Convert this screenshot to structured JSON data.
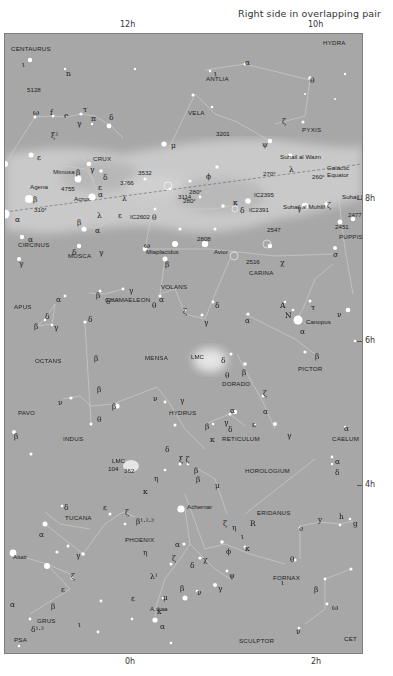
{
  "caption": "Right side in overlapping pair",
  "hour_labels": {
    "top": [
      {
        "text": "12h",
        "x": 120
      },
      {
        "text": "10h",
        "x": 308
      }
    ],
    "right": [
      {
        "text": "8h",
        "y": 198
      },
      {
        "text": "6h",
        "y": 340
      },
      {
        "text": "4h",
        "y": 484
      }
    ],
    "bottom": [
      {
        "text": "0h",
        "x": 125
      },
      {
        "text": "2h",
        "x": 311
      }
    ]
  },
  "colors": {
    "sky": "#a7a7a7",
    "milky_way": "#c4c4c4",
    "lines": "#cfcfcf",
    "stars": "#ffffff"
  },
  "constellations": [
    {
      "name": "CENTAURUS",
      "x": 6,
      "y": 12
    },
    {
      "name": "HYDRA",
      "x": 318,
      "y": 6
    },
    {
      "name": "ANTLIA",
      "x": 201,
      "y": 42
    },
    {
      "name": "VELA",
      "x": 183,
      "y": 76
    },
    {
      "name": "PYXIS",
      "x": 297,
      "y": 93
    },
    {
      "name": "CRUX",
      "x": 88,
      "y": 122
    },
    {
      "name": "CARINA",
      "x": 244,
      "y": 236
    },
    {
      "name": "PUPPIS",
      "x": 334,
      "y": 200
    },
    {
      "name": "CIRCINUS",
      "x": 13,
      "y": 208
    },
    {
      "name": "MUSCA",
      "x": 63,
      "y": 219
    },
    {
      "name": "CHAMAELEON",
      "x": 100,
      "y": 263
    },
    {
      "name": "APUS",
      "x": 9,
      "y": 270
    },
    {
      "name": "VOLANS",
      "x": 156,
      "y": 250
    },
    {
      "name": "OCTANS",
      "x": 30,
      "y": 324
    },
    {
      "name": "MENSA",
      "x": 140,
      "y": 321
    },
    {
      "name": "PICTOR",
      "x": 293,
      "y": 332
    },
    {
      "name": "DORADO",
      "x": 217,
      "y": 347
    },
    {
      "name": "PAVO",
      "x": 13,
      "y": 376
    },
    {
      "name": "HYDRUS",
      "x": 164,
      "y": 376
    },
    {
      "name": "INDUS",
      "x": 58,
      "y": 402
    },
    {
      "name": "RETICULUM",
      "x": 217,
      "y": 402
    },
    {
      "name": "CAELUM",
      "x": 327,
      "y": 402
    },
    {
      "name": "HOROLOGIUM",
      "x": 240,
      "y": 434
    },
    {
      "name": "TUCANA",
      "x": 60,
      "y": 481
    },
    {
      "name": "ERIDANUS",
      "x": 252,
      "y": 476
    },
    {
      "name": "PHOENIX",
      "x": 120,
      "y": 503
    },
    {
      "name": "FORNAX",
      "x": 268,
      "y": 541
    },
    {
      "name": "GRUS",
      "x": 32,
      "y": 584
    },
    {
      "name": "SCULPTOR",
      "x": 234,
      "y": 604
    },
    {
      "name": "PsA",
      "x": 9,
      "y": 603
    },
    {
      "name": "Cet",
      "x": 339,
      "y": 602
    }
  ],
  "named_stars": [
    {
      "name": "Mimosa",
      "x": 48,
      "y": 135
    },
    {
      "name": "Agena",
      "x": 25,
      "y": 150
    },
    {
      "name": "Acrux",
      "x": 69,
      "y": 162
    },
    {
      "name": "Miaplacidus",
      "x": 141,
      "y": 215
    },
    {
      "name": "Avior",
      "x": 209,
      "y": 215
    },
    {
      "name": "Suhail al Wazn",
      "x": 275,
      "y": 120
    },
    {
      "name": "Suhail al Muhlif",
      "x": 278,
      "y": 170
    },
    {
      "name": "Suhail Hadar",
      "x": 337,
      "y": 160
    },
    {
      "name": "Canopus",
      "x": 301,
      "y": 285
    },
    {
      "name": "Achernar",
      "x": 182,
      "y": 470
    },
    {
      "name": "Ankaa",
      "x": 145,
      "y": 572
    },
    {
      "name": "Altair",
      "x": 8,
      "y": 520
    }
  ],
  "deep_sky": [
    {
      "id": "5128",
      "x": 22,
      "y": 53
    },
    {
      "id": "3201",
      "x": 211,
      "y": 97
    },
    {
      "id": "4755",
      "x": 56,
      "y": 152
    },
    {
      "id": "3532",
      "x": 133,
      "y": 136
    },
    {
      "id": "3766",
      "x": 115,
      "y": 146
    },
    {
      "id": "3114",
      "x": 173,
      "y": 160
    },
    {
      "id": "IC2602",
      "x": 125,
      "y": 180
    },
    {
      "id": "IC2395",
      "x": 249,
      "y": 158
    },
    {
      "id": "IC2391",
      "x": 244,
      "y": 173
    },
    {
      "id": "2547",
      "x": 262,
      "y": 193
    },
    {
      "id": "2808",
      "x": 192,
      "y": 202
    },
    {
      "id": "2516",
      "x": 241,
      "y": 225
    },
    {
      "id": "2477",
      "x": 343,
      "y": 178
    },
    {
      "id": "2451",
      "x": 330,
      "y": 190
    },
    {
      "id": "104",
      "x": 103,
      "y": 432
    },
    {
      "id": "362",
      "x": 119,
      "y": 434
    }
  ],
  "galactic": {
    "label": "Galactic Equator",
    "longitudes": [
      {
        "text": "310°",
        "x": 29,
        "y": 173
      },
      {
        "text": "280°",
        "x": 184,
        "y": 155
      },
      {
        "text": "270°",
        "x": 258,
        "y": 137
      },
      {
        "text": "260°",
        "x": 307,
        "y": 140
      },
      {
        "text": "280°",
        "x": 178,
        "y": 164
      }
    ]
  },
  "clouds": [
    {
      "name": "LMC",
      "x": 186,
      "y": 320
    },
    {
      "name": "LMC",
      "x": 107,
      "y": 424
    }
  ],
  "greek_labels": [
    {
      "t": "ι",
      "x": 17,
      "y": 27
    },
    {
      "t": "n",
      "x": 61,
      "y": 36
    },
    {
      "t": "ι",
      "x": 209,
      "y": 36
    },
    {
      "t": "ω",
      "x": 28,
      "y": 75
    },
    {
      "t": "f",
      "x": 45,
      "y": 75
    },
    {
      "t": "e",
      "x": 59,
      "y": 78
    },
    {
      "t": "τ",
      "x": 78,
      "y": 72
    },
    {
      "t": "γ",
      "x": 72,
      "y": 86
    },
    {
      "t": "π",
      "x": 86,
      "y": 81
    },
    {
      "t": "δ",
      "x": 104,
      "y": 80
    },
    {
      "t": "ξ²",
      "x": 46,
      "y": 98
    },
    {
      "t": "ε",
      "x": 32,
      "y": 120
    },
    {
      "t": "α",
      "x": 240,
      "y": 25
    },
    {
      "t": "θ",
      "x": 305,
      "y": 43
    },
    {
      "t": "ζ",
      "x": 277,
      "y": 84
    },
    {
      "t": "μ",
      "x": 166,
      "y": 108
    },
    {
      "t": "ψ",
      "x": 257,
      "y": 107
    },
    {
      "t": "λ",
      "x": 284,
      "y": 132
    },
    {
      "t": "β",
      "x": 71,
      "y": 135
    },
    {
      "t": "γ",
      "x": 85,
      "y": 132
    },
    {
      "t": "δ",
      "x": 98,
      "y": 140
    },
    {
      "t": "ε",
      "x": 93,
      "y": 150
    },
    {
      "t": "β",
      "x": 28,
      "y": 162
    },
    {
      "t": "α",
      "x": 93,
      "y": 157
    },
    {
      "t": "λ",
      "x": 117,
      "y": 161
    },
    {
      "t": "α",
      "x": 10,
      "y": 182
    },
    {
      "t": "β",
      "x": 72,
      "y": 185
    },
    {
      "t": "λ",
      "x": 92,
      "y": 178
    },
    {
      "t": "α",
      "x": 90,
      "y": 193
    },
    {
      "t": "ε",
      "x": 113,
      "y": 178
    },
    {
      "t": "θ",
      "x": 147,
      "y": 180
    },
    {
      "t": "ω",
      "x": 139,
      "y": 208
    },
    {
      "t": "α",
      "x": 23,
      "y": 202
    },
    {
      "t": "δ",
      "x": 67,
      "y": 215
    },
    {
      "t": "γ",
      "x": 94,
      "y": 215
    },
    {
      "t": "ϕ",
      "x": 201,
      "y": 139
    },
    {
      "t": "δ",
      "x": 235,
      "y": 173
    },
    {
      "t": "κ",
      "x": 228,
      "y": 165
    },
    {
      "t": "γ",
      "x": 292,
      "y": 171
    },
    {
      "t": "ζ",
      "x": 322,
      "y": 168
    },
    {
      "t": "σ",
      "x": 328,
      "y": 217
    },
    {
      "t": "χ",
      "x": 275,
      "y": 225
    },
    {
      "t": "γ",
      "x": 14,
      "y": 226
    },
    {
      "t": "β",
      "x": 160,
      "y": 227
    },
    {
      "t": "β",
      "x": 91,
      "y": 258
    },
    {
      "t": "γ",
      "x": 124,
      "y": 253
    },
    {
      "t": "δ¹·²",
      "x": 101,
      "y": 264
    },
    {
      "t": "α",
      "x": 154,
      "y": 262
    },
    {
      "t": "θ",
      "x": 147,
      "y": 268
    },
    {
      "t": "α",
      "x": 51,
      "y": 262
    },
    {
      "t": "δ",
      "x": 40,
      "y": 279
    },
    {
      "t": "β",
      "x": 29,
      "y": 289
    },
    {
      "t": "γ",
      "x": 49,
      "y": 290
    },
    {
      "t": "δ",
      "x": 83,
      "y": 282
    },
    {
      "t": "ζ",
      "x": 178,
      "y": 274
    },
    {
      "t": "δ",
      "x": 210,
      "y": 268
    },
    {
      "t": "γ",
      "x": 199,
      "y": 285
    },
    {
      "t": "α",
      "x": 240,
      "y": 283
    },
    {
      "t": "A",
      "x": 275,
      "y": 268
    },
    {
      "t": "N",
      "x": 280,
      "y": 278
    },
    {
      "t": "τ",
      "x": 306,
      "y": 270
    },
    {
      "t": "ν",
      "x": 332,
      "y": 277
    },
    {
      "t": "α",
      "x": 295,
      "y": 294
    },
    {
      "t": "δ",
      "x": 216,
      "y": 323
    },
    {
      "t": "θ",
      "x": 220,
      "y": 338
    },
    {
      "t": "β",
      "x": 237,
      "y": 335
    },
    {
      "t": "β",
      "x": 310,
      "y": 319
    },
    {
      "t": "ζ",
      "x": 258,
      "y": 356
    },
    {
      "t": "β",
      "x": 89,
      "y": 321
    },
    {
      "t": "β",
      "x": 92,
      "y": 352
    },
    {
      "t": "ν",
      "x": 53,
      "y": 365
    },
    {
      "t": "β",
      "x": 107,
      "y": 369
    },
    {
      "t": "θ",
      "x": 92,
      "y": 382
    },
    {
      "t": "ν",
      "x": 148,
      "y": 361
    },
    {
      "t": "γ",
      "x": 175,
      "y": 363
    },
    {
      "t": "β",
      "x": 9,
      "y": 399
    },
    {
      "t": "α",
      "x": 225,
      "y": 373
    },
    {
      "t": "α",
      "x": 258,
      "y": 374
    },
    {
      "t": "γ",
      "x": 282,
      "y": 398
    },
    {
      "t": "β",
      "x": 200,
      "y": 389
    },
    {
      "t": "γ",
      "x": 219,
      "y": 385
    },
    {
      "t": "δ",
      "x": 223,
      "y": 392
    },
    {
      "t": "ε",
      "x": 247,
      "y": 387
    },
    {
      "t": "κ",
      "x": 205,
      "y": 402
    },
    {
      "t": "ξ ζ",
      "x": 174,
      "y": 422
    },
    {
      "t": "δ",
      "x": 160,
      "y": 412
    },
    {
      "t": "β",
      "x": 189,
      "y": 433
    },
    {
      "t": "η",
      "x": 149,
      "y": 441
    },
    {
      "t": "κ",
      "x": 138,
      "y": 454
    },
    {
      "t": "μ",
      "x": 210,
      "y": 448
    },
    {
      "t": "β",
      "x": 191,
      "y": 442
    },
    {
      "t": "ζ",
      "x": 218,
      "y": 486
    },
    {
      "t": "η",
      "x": 227,
      "y": 490
    },
    {
      "t": "ι",
      "x": 236,
      "y": 499
    },
    {
      "t": "R",
      "x": 245,
      "y": 486
    },
    {
      "t": "α",
      "x": 330,
      "y": 424
    },
    {
      "t": "δ",
      "x": 330,
      "y": 435
    },
    {
      "t": "α",
      "x": 339,
      "y": 391
    },
    {
      "t": "e",
      "x": 294,
      "y": 491
    },
    {
      "t": "y",
      "x": 313,
      "y": 482
    },
    {
      "t": "h",
      "x": 334,
      "y": 479
    },
    {
      "t": "g",
      "x": 348,
      "y": 486
    },
    {
      "t": "δ",
      "x": 59,
      "y": 470
    },
    {
      "t": "α",
      "x": 34,
      "y": 497
    },
    {
      "t": "γ",
      "x": 71,
      "y": 518
    },
    {
      "t": "ε",
      "x": 98,
      "y": 470
    },
    {
      "t": "ζ",
      "x": 120,
      "y": 475
    },
    {
      "t": "β¹·²·³",
      "x": 131,
      "y": 484
    },
    {
      "t": "α",
      "x": 170,
      "y": 507
    },
    {
      "t": "χ",
      "x": 198,
      "y": 522
    },
    {
      "t": "ϕ",
      "x": 221,
      "y": 514
    },
    {
      "t": "κ",
      "x": 240,
      "y": 511
    },
    {
      "t": "θ",
      "x": 285,
      "y": 522
    },
    {
      "t": "ι",
      "x": 276,
      "y": 545
    },
    {
      "t": "η",
      "x": 138,
      "y": 515
    },
    {
      "t": "ζ",
      "x": 167,
      "y": 521
    },
    {
      "t": "δ",
      "x": 185,
      "y": 528
    },
    {
      "t": "ψ",
      "x": 224,
      "y": 538
    },
    {
      "t": "ν",
      "x": 192,
      "y": 555
    },
    {
      "t": "γ",
      "x": 213,
      "y": 551
    },
    {
      "t": "β",
      "x": 175,
      "y": 551
    },
    {
      "t": "λ¹",
      "x": 145,
      "y": 539
    },
    {
      "t": "μ",
      "x": 158,
      "y": 560
    },
    {
      "t": "ε",
      "x": 126,
      "y": 561
    },
    {
      "t": "κ",
      "x": 152,
      "y": 574
    },
    {
      "t": "α",
      "x": 155,
      "y": 589
    },
    {
      "t": "α",
      "x": 357,
      "y": 541
    },
    {
      "t": "β",
      "x": 309,
      "y": 552
    },
    {
      "t": "ω",
      "x": 327,
      "y": 570
    },
    {
      "t": "ν",
      "x": 291,
      "y": 594
    },
    {
      "t": "ζ",
      "x": 66,
      "y": 539
    },
    {
      "t": "ε",
      "x": 56,
      "y": 552
    },
    {
      "t": "β",
      "x": 46,
      "y": 569
    },
    {
      "t": "α",
      "x": 5,
      "y": 567
    },
    {
      "t": "ι",
      "x": 73,
      "y": 587
    },
    {
      "t": "δ¹·²",
      "x": 26,
      "y": 592
    }
  ]
}
